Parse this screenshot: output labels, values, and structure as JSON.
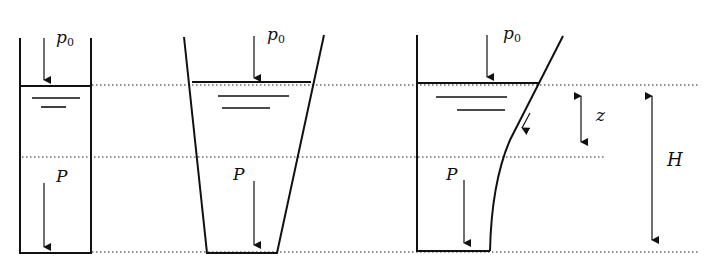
{
  "diagram": {
    "labels": {
      "surface_pressure": "p",
      "surface_pressure_sub": "0",
      "force": "P",
      "depth_z": "z",
      "height_H": "H"
    },
    "containers": [
      {
        "name": "straight-container",
        "shape": "rectangular"
      },
      {
        "name": "tapered-container",
        "shape": "trapezoid (wider at top)"
      },
      {
        "name": "curved-wall-container",
        "shape": "one vertical wall, one curved wall"
      }
    ],
    "levels": {
      "free_surface_y": 85,
      "mid_depth_y": 157,
      "bottom_y": 252
    },
    "colors": {
      "line": "#111111",
      "background": "#ffffff"
    }
  }
}
